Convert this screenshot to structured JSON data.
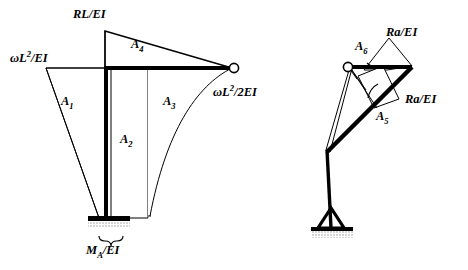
{
  "figure": {
    "background_color": "#ffffff",
    "line_color": "#000000",
    "hatch_color": "#808080",
    "width": 468,
    "height": 270
  },
  "left_diagram": {
    "name": "primary-frame-moment-diagram",
    "labels": {
      "omega_l2_ei": "ωL²/EI",
      "omega_l2_ei_parts": {
        "pre": "ωL",
        "sup": "2",
        "post": "/EI"
      },
      "rl_ei": "RL/EI",
      "omega_l2_2ei": "ωL²/2EI",
      "omega_l2_2ei_parts": {
        "pre": "ωL",
        "sup": "2",
        "post": "/2EI"
      },
      "ma_ei": "Mₐ/EI",
      "ma_ei_parts": {
        "pre": "M",
        "sub": "A",
        "post": "/EI"
      }
    },
    "areas": [
      {
        "id": "A1",
        "label": "A",
        "subscript": "1",
        "shape": "triangle-left-of-column"
      },
      {
        "id": "A2",
        "label": "A",
        "subscript": "2",
        "shape": "rectangle-right-of-column"
      },
      {
        "id": "A3",
        "label": "A",
        "subscript": "3",
        "shape": "parabolic-segment"
      },
      {
        "id": "A4",
        "label": "A",
        "subscript": "4",
        "shape": "triangle-above-beam"
      }
    ],
    "support": {
      "type": "fixed",
      "position": "column-base",
      "hatched": true
    },
    "joint": {
      "type": "pin-circle",
      "position": "beam-right-end"
    }
  },
  "right_diagram": {
    "name": "released-frame-moment-diagram",
    "labels": {
      "ra_ei_top": "Ra/EI",
      "ra_ei_right": "Ra/EI"
    },
    "areas": [
      {
        "id": "A5",
        "label": "A",
        "subscript": "5",
        "shape": "parallelogram-lower"
      },
      {
        "id": "A6",
        "label": "A",
        "subscript": "6",
        "shape": "parallelogram-upper"
      }
    ],
    "support": {
      "type": "pinned-triangle",
      "position": "column-base",
      "hatched": true
    },
    "joint": {
      "type": "pin-circle",
      "position": "beam-left-end"
    }
  }
}
